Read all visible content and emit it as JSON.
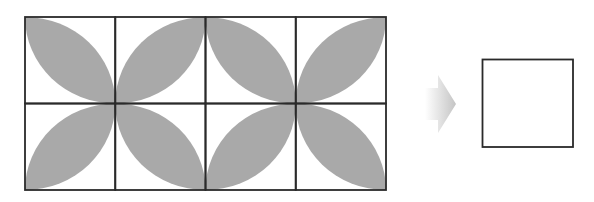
{
  "figure": {
    "grid": {
      "rows": 2,
      "cols": 4,
      "x": 25,
      "y": 17,
      "cell_w": 90.25,
      "cell_h": 86.5,
      "leaf_orientation": [
        [
          "tl-br",
          "bl-tr",
          "tl-br",
          "bl-tr"
        ],
        [
          "bl-tr",
          "tl-br",
          "bl-tr",
          "tl-br"
        ]
      ]
    },
    "arrow": {
      "direction": "right",
      "style": "gradient"
    },
    "answer_box": {
      "content": ""
    },
    "colors": {
      "leaf": "#a9a9a9",
      "line": "#2a2a2a",
      "arrow_start": "#ffffff",
      "arrow_end": "#c8c8c8",
      "background": "#ffffff"
    }
  }
}
